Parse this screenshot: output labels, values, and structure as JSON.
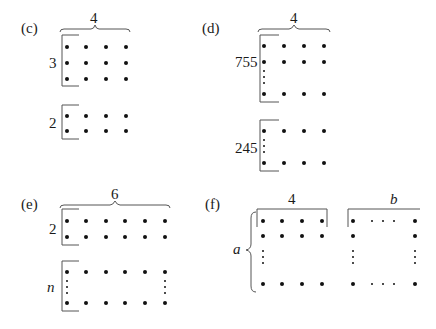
{
  "panels": {
    "c": {
      "label": "(c)",
      "width_label": "4",
      "top_rows_label": "3",
      "bottom_rows_label": "2"
    },
    "d": {
      "label": "(d)",
      "width_label": "4",
      "top_rows_label": "755",
      "bottom_rows_label": "245"
    },
    "e": {
      "label": "(e)",
      "width_label": "6",
      "top_rows_label": "2",
      "bottom_rows_label": "n"
    },
    "f": {
      "label": "(f)",
      "left_width_label": "4",
      "right_width_label": "b",
      "rows_label": "a"
    }
  },
  "colors": {
    "dot": "#111111",
    "bracket": "#555555",
    "text": "#1a1a1a"
  }
}
